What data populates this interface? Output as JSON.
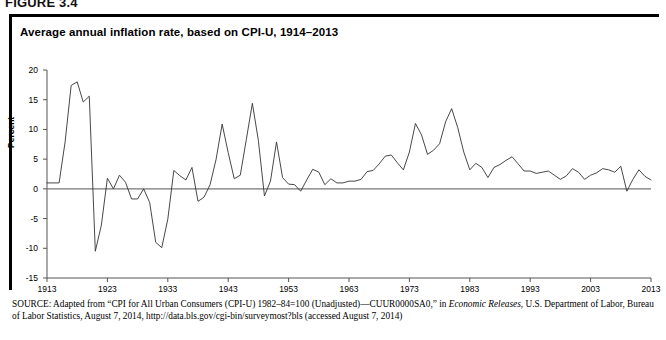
{
  "figure": {
    "number_label": "FIGURE 3.4",
    "title": "Average annual inflation rate, based on CPI-U, 1914–2013"
  },
  "axes": {
    "ylabel": "Percent",
    "yticks": [
      "20",
      "15",
      "10",
      "5",
      "0",
      "-5",
      "-10",
      "-15"
    ],
    "xticks": [
      "1913",
      "1923",
      "1933",
      "1943",
      "1953",
      "1963",
      "1973",
      "1983",
      "1993",
      "2003",
      "2013"
    ]
  },
  "source": {
    "label": "SOURCE:",
    "line1_a": " Adapted from “CPI for All Urban Consumers (CPI-U) 1982–84=100 (Unadjusted)—CUUR0000SA0,” in ",
    "line1_italic": "Economic Releases",
    "line1_b": ", U.S. Department of Labor, Bureau of Labor Statistics, August 7, 2014, http://data.bls.gov/cgi-bin/surveymost?bls (accessed August 7, 2014)"
  },
  "colors": {
    "line": "#333333",
    "axis": "#555555",
    "zero_line": "#777777",
    "frame": "#000000"
  },
  "chart_data": {
    "type": "line",
    "title": "Average annual inflation rate, based on CPI-U, 1914–2013",
    "xlabel": "",
    "ylabel": "Percent",
    "xlim": [
      1913,
      2013
    ],
    "ylim": [
      -15,
      20
    ],
    "grid": false,
    "legend": "none",
    "series": [
      {
        "name": "Average annual inflation rate (CPI-U)",
        "x": [
          1913,
          1914,
          1915,
          1916,
          1917,
          1918,
          1919,
          1920,
          1921,
          1922,
          1923,
          1924,
          1925,
          1926,
          1927,
          1928,
          1929,
          1930,
          1931,
          1932,
          1933,
          1934,
          1935,
          1936,
          1937,
          1938,
          1939,
          1940,
          1941,
          1942,
          1943,
          1944,
          1945,
          1946,
          1947,
          1948,
          1949,
          1950,
          1951,
          1952,
          1953,
          1954,
          1955,
          1956,
          1957,
          1958,
          1959,
          1960,
          1961,
          1962,
          1963,
          1964,
          1965,
          1966,
          1967,
          1968,
          1969,
          1970,
          1971,
          1972,
          1973,
          1974,
          1975,
          1976,
          1977,
          1978,
          1979,
          1980,
          1981,
          1982,
          1983,
          1984,
          1985,
          1986,
          1987,
          1988,
          1989,
          1990,
          1991,
          1992,
          1993,
          1994,
          1995,
          1996,
          1997,
          1998,
          1999,
          2000,
          2001,
          2002,
          2003,
          2004,
          2005,
          2006,
          2007,
          2008,
          2009,
          2010,
          2011,
          2012,
          2013
        ],
        "values": [
          1.0,
          1.0,
          1.0,
          7.9,
          17.4,
          18.0,
          14.6,
          15.6,
          -10.5,
          -6.1,
          1.8,
          0.0,
          2.3,
          1.1,
          -1.7,
          -1.7,
          0.0,
          -2.3,
          -9.0,
          -9.9,
          -5.1,
          3.1,
          2.2,
          1.5,
          3.6,
          -2.1,
          -1.4,
          0.7,
          5.0,
          10.9,
          6.1,
          1.7,
          2.3,
          8.3,
          14.4,
          8.1,
          -1.2,
          1.3,
          7.9,
          1.9,
          0.8,
          0.7,
          -0.4,
          1.5,
          3.3,
          2.8,
          0.7,
          1.7,
          1.0,
          1.0,
          1.3,
          1.3,
          1.6,
          2.9,
          3.1,
          4.2,
          5.5,
          5.7,
          4.4,
          3.2,
          6.2,
          11.0,
          9.1,
          5.8,
          6.5,
          7.6,
          11.3,
          13.5,
          10.3,
          6.2,
          3.2,
          4.3,
          3.6,
          1.9,
          3.6,
          4.1,
          4.8,
          5.4,
          4.2,
          3.0,
          3.0,
          2.6,
          2.8,
          3.0,
          2.3,
          1.6,
          2.2,
          3.4,
          2.8,
          1.6,
          2.3,
          2.7,
          3.4,
          3.2,
          2.8,
          3.8,
          -0.4,
          1.6,
          3.2,
          2.1,
          1.5
        ]
      }
    ]
  }
}
